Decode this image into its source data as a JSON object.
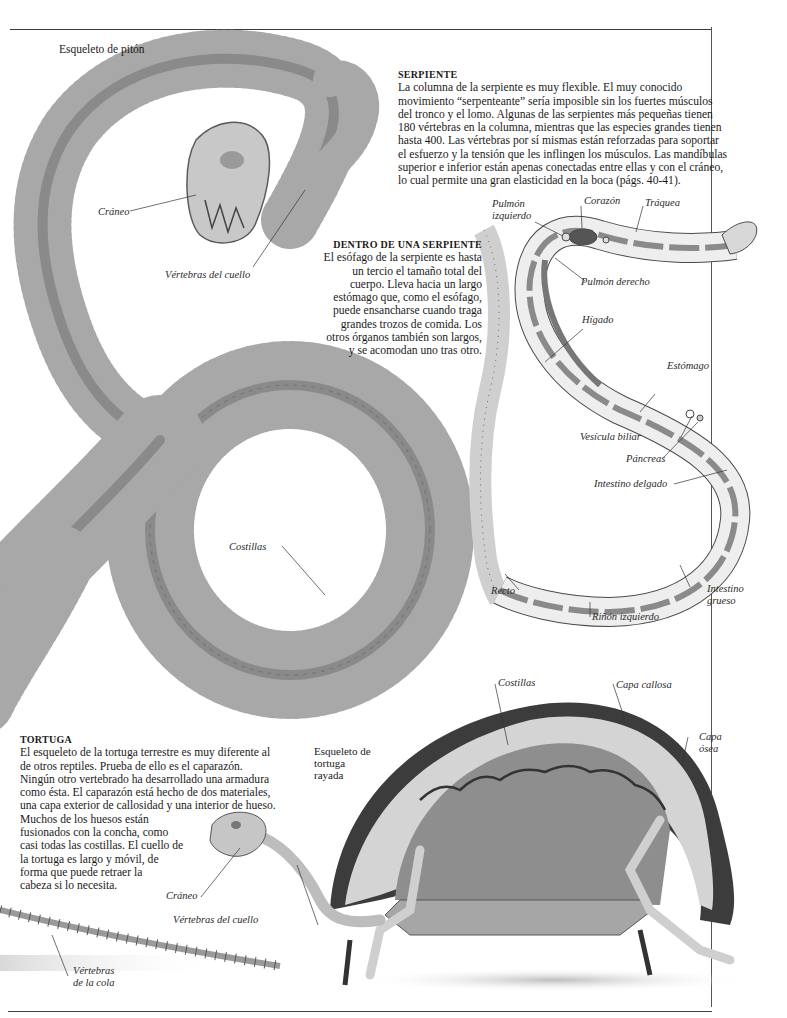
{
  "page": {
    "top_caption": "Esqueleto de pitón"
  },
  "serpiente": {
    "heading": "SERPIENTE",
    "lines": [
      "La columna de la serpiente es muy flexible. El muy conocido",
      "movimiento “serpenteante” sería imposible sin los fuertes músculos",
      "del tronco y el lomo. Algunas de las serpientes más pequeñas tienen",
      "180 vértebras en la columna, mientras que las especies grandes tienen",
      "hasta 400. Las vértebras por sí mismas están reforzadas para soportar",
      "el esfuerzo y la tensión que les inflingen los músculos. Las mandíbulas",
      "superior e inferior están apenas conectadas entre ellas y con el cráneo,",
      "lo cual permite una gran elasticidad en la boca (págs. 40-41)."
    ]
  },
  "dentro": {
    "heading": "DENTRO DE UNA SERPIENTE",
    "lines": [
      "El esófago de la serpiente es hasta",
      "un tercio el tamaño total del",
      "cuerpo. Lleva hacia un largo",
      "estómago que, como el esófago,",
      "puede ensancharse cuando traga",
      "grandes trozos de comida. Los",
      "otros órganos también son largos,",
      "y se acomodan uno tras otro."
    ]
  },
  "python_labels": {
    "skull": "Cráneo",
    "neck_vertebrae": "Vértebras del cuello",
    "ribs": "Costillas"
  },
  "anatomy_labels": {
    "left_lung_1": "Pulmón",
    "left_lung_2": "izquierdo",
    "heart": "Corazón",
    "trachea": "Tráquea",
    "right_lung": "Pulmón derecho",
    "liver": "Hígado",
    "stomach": "Estómago",
    "gall_bladder": "Vesícula biliar",
    "pancreas": "Páncreas",
    "small_intestine": "Intestino delgado",
    "rectum": "Recto",
    "large_intestine_1": "Intestino",
    "large_intestine_2": "grueso",
    "left_kidney": "Riñón izquierdo"
  },
  "tortuga": {
    "heading": "TORTUGA",
    "lines": [
      "El esqueleto de la tortuga terrestre es muy diferente al",
      "de otros reptiles. Prueba de ello es el caparazón.",
      "Ningún otro vertebrado ha desarrollado una armadura",
      "como ésta. El caparazón está hecho de dos materiales,",
      "una capa exterior de callosidad y una interior de hueso.",
      "Muchos de los huesos están",
      "fusionados con la concha, como",
      "casi todas las costillas. El cuello de",
      "la tortuga es largo y móvil, de",
      "forma que puede retraer la",
      "cabeza si lo necesita."
    ]
  },
  "turtle_caption": {
    "line1": "Esqueleto de",
    "line2": "tortuga",
    "line3": "rayada"
  },
  "turtle_labels": {
    "ribs": "Costillas",
    "horny_layer": "Capa callosa",
    "bony_layer_1": "Capa",
    "bony_layer_2": "ósea",
    "skull": "Cráneo",
    "neck_vertebrae": "Vértebras del cuello",
    "tail_vertebrae_1": "Vértebras",
    "tail_vertebrae_2": "de la cola"
  },
  "colors": {
    "bone": "#b9b9b9",
    "bone_dark": "#7a7a7a",
    "shell_dark": "#3c3c3c",
    "shell_inner": "#8e8e8e",
    "diagram_fill": "#eeeeee",
    "diagram_line": "#4a4a4a",
    "organ_dark": "#555555"
  }
}
